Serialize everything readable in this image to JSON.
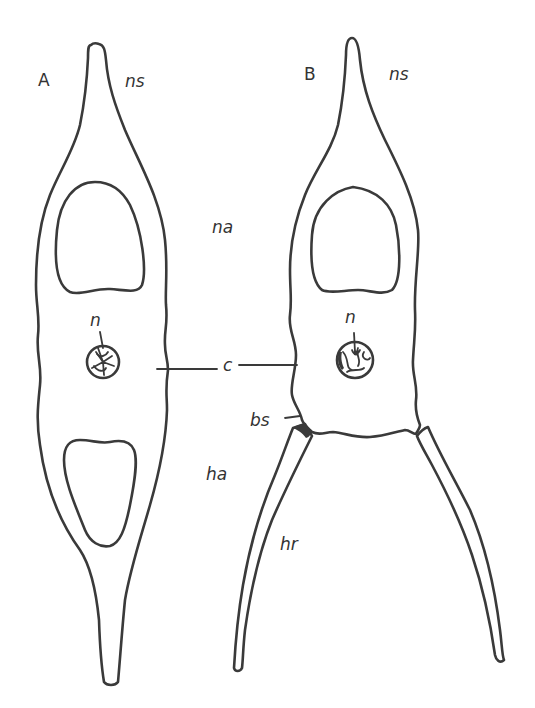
{
  "diagram": {
    "type": "anatomical-line-drawing",
    "panels": [
      {
        "id": "A",
        "label": "A",
        "parts": [
          "ns",
          "na",
          "n",
          "c",
          "ha"
        ]
      },
      {
        "id": "B",
        "label": "B",
        "parts": [
          "ns",
          "n",
          "c",
          "bs",
          "hr"
        ]
      }
    ],
    "labels": {
      "panel_a": "A",
      "panel_b": "B",
      "ns_a": "ns",
      "ns_b": "ns",
      "na": "na",
      "n_a": "n",
      "n_b": "n",
      "c": "c",
      "bs": "bs",
      "ha": "ha",
      "hr": "hr"
    },
    "colors": {
      "line": "#3a3a3a",
      "background": "#ffffff",
      "text": "#333333"
    }
  }
}
